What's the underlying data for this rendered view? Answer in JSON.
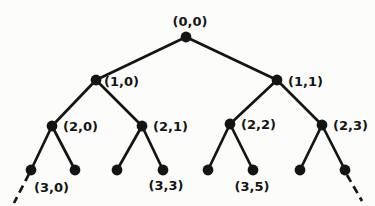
{
  "diagram": {
    "type": "tree",
    "ink_color": "#141414",
    "background_color": "#fcfcfa",
    "node_radius": 5.4,
    "edge_width": 2.7,
    "dash_pattern": "8 5",
    "label_font_size": 13,
    "nodes": [
      {
        "id": "0,0",
        "x": 186,
        "y": 37,
        "label": "(0,0)",
        "label_x": 190,
        "label_y": 26,
        "label_anchor": "middle"
      },
      {
        "id": "1,0",
        "x": 96,
        "y": 80,
        "label": "(1,0)",
        "label_x": 104,
        "label_y": 86,
        "label_anchor": "start"
      },
      {
        "id": "1,1",
        "x": 277,
        "y": 80,
        "label": "(1,1)",
        "label_x": 288,
        "label_y": 86,
        "label_anchor": "start"
      },
      {
        "id": "2,0",
        "x": 52,
        "y": 126,
        "label": "(2,0)",
        "label_x": 63,
        "label_y": 131,
        "label_anchor": "start"
      },
      {
        "id": "2,1",
        "x": 142,
        "y": 126,
        "label": "(2,1)",
        "label_x": 153,
        "label_y": 131,
        "label_anchor": "start"
      },
      {
        "id": "2,2",
        "x": 230,
        "y": 124,
        "label": "(2,2)",
        "label_x": 241,
        "label_y": 129,
        "label_anchor": "start"
      },
      {
        "id": "2,3",
        "x": 322,
        "y": 125,
        "label": "(2,3)",
        "label_x": 333,
        "label_y": 130,
        "label_anchor": "start"
      },
      {
        "id": "3,0",
        "x": 31,
        "y": 170,
        "label": "(3,0)",
        "label_x": 34,
        "label_y": 192,
        "label_anchor": "start"
      },
      {
        "id": "3,1",
        "x": 75,
        "y": 170,
        "label": ""
      },
      {
        "id": "3,2",
        "x": 117,
        "y": 170,
        "label": ""
      },
      {
        "id": "3,3",
        "x": 163,
        "y": 170,
        "label": "(3,3)",
        "label_x": 166,
        "label_y": 190,
        "label_anchor": "middle"
      },
      {
        "id": "3,4",
        "x": 208,
        "y": 170,
        "label": ""
      },
      {
        "id": "3,5",
        "x": 253,
        "y": 170,
        "label": "(3,5)",
        "label_x": 252,
        "label_y": 191,
        "label_anchor": "middle"
      },
      {
        "id": "3,6",
        "x": 300,
        "y": 170,
        "label": ""
      },
      {
        "id": "3,7",
        "x": 345,
        "y": 170,
        "label": ""
      }
    ],
    "edges": [
      {
        "from": "0,0",
        "to": "1,0"
      },
      {
        "from": "0,0",
        "to": "1,1"
      },
      {
        "from": "1,0",
        "to": "2,0"
      },
      {
        "from": "1,0",
        "to": "2,1"
      },
      {
        "from": "1,1",
        "to": "2,2"
      },
      {
        "from": "1,1",
        "to": "2,3"
      },
      {
        "from": "2,0",
        "to": "3,0"
      },
      {
        "from": "2,0",
        "to": "3,1"
      },
      {
        "from": "2,1",
        "to": "3,2"
      },
      {
        "from": "2,1",
        "to": "3,3"
      },
      {
        "from": "2,2",
        "to": "3,4"
      },
      {
        "from": "2,2",
        "to": "3,5"
      },
      {
        "from": "2,3",
        "to": "3,6"
      },
      {
        "from": "2,3",
        "to": "3,7"
      }
    ],
    "dashed_rays": [
      {
        "from": "3,0",
        "x1": 29,
        "y1": 174,
        "x2": 14,
        "y2": 203
      },
      {
        "from": "3,7",
        "x1": 347,
        "y1": 175,
        "x2": 362,
        "y2": 201
      }
    ]
  }
}
